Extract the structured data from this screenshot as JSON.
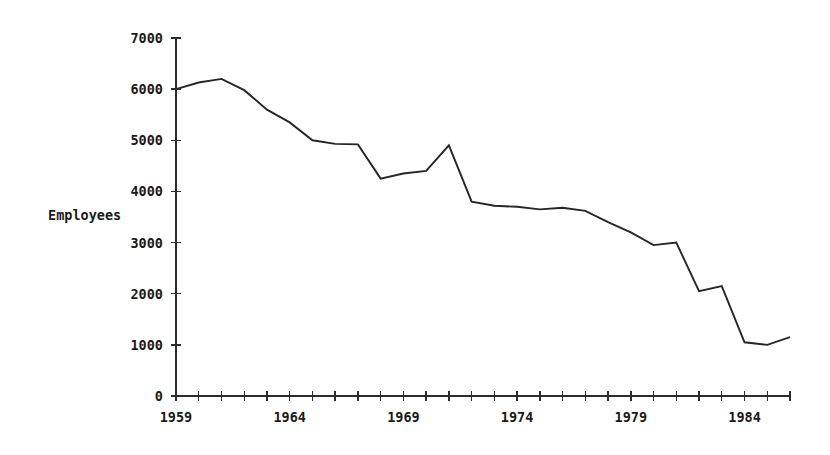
{
  "chart_data": {
    "type": "line",
    "title": "",
    "xlabel": "",
    "ylabel": "Employees",
    "xlim": [
      1959,
      1986
    ],
    "ylim": [
      0,
      7000
    ],
    "grid": false,
    "legend": null,
    "y_ticks": [
      0,
      1000,
      2000,
      3000,
      4000,
      5000,
      6000,
      7000
    ],
    "y_tick_labels": [
      "0",
      "1000",
      "2000",
      "3000",
      "4000",
      "5000",
      "6000",
      "7000"
    ],
    "x_ticks": [
      1959,
      1960,
      1961,
      1962,
      1963,
      1964,
      1965,
      1966,
      1967,
      1968,
      1969,
      1970,
      1971,
      1972,
      1973,
      1974,
      1975,
      1976,
      1977,
      1978,
      1979,
      1980,
      1981,
      1982,
      1983,
      1984,
      1985,
      1986
    ],
    "x_tick_labels": [
      "1959",
      "1964",
      "1969",
      "1974",
      "1979",
      "1984"
    ],
    "x_labeled_ticks": [
      1959,
      1964,
      1969,
      1974,
      1979,
      1984
    ],
    "series": [
      {
        "name": "Employees",
        "color": "#262626",
        "x": [
          1959,
          1960,
          1961,
          1962,
          1963,
          1964,
          1965,
          1966,
          1967,
          1968,
          1969,
          1970,
          1971,
          1972,
          1973,
          1974,
          1975,
          1976,
          1977,
          1978,
          1979,
          1980,
          1981,
          1982,
          1983,
          1984,
          1985,
          1986
        ],
        "values": [
          6000,
          6130,
          6200,
          5980,
          5600,
          5350,
          5000,
          4930,
          4920,
          4250,
          4350,
          4400,
          4900,
          3800,
          3720,
          3700,
          3650,
          3680,
          3620,
          3400,
          3200,
          2950,
          3000,
          2050,
          2150,
          1050,
          1000,
          1150
        ]
      }
    ]
  },
  "axis_labels": {
    "y_axis_title": "Employees"
  },
  "colors": {
    "line": "#262626",
    "axis": "#2b2b2b",
    "text": "#1a1a1a",
    "background": "#ffffff"
  }
}
